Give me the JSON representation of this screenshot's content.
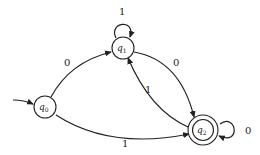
{
  "diagram": {
    "type": "finite-automaton",
    "states": [
      {
        "id": "q0",
        "name": "q",
        "sub": "0",
        "start": true,
        "accept": false
      },
      {
        "id": "q1",
        "name": "q",
        "sub": "1",
        "start": false,
        "accept": false
      },
      {
        "id": "q2",
        "name": "q",
        "sub": "2",
        "start": false,
        "accept": true
      }
    ],
    "transitions": [
      {
        "from": "q0",
        "to": "q1",
        "label": "0"
      },
      {
        "from": "q0",
        "to": "q2",
        "label": "1"
      },
      {
        "from": "q1",
        "to": "q1",
        "label": "1"
      },
      {
        "from": "q1",
        "to": "q2",
        "label": "0"
      },
      {
        "from": "q2",
        "to": "q1",
        "label": "1"
      },
      {
        "from": "q2",
        "to": "q2",
        "label": "0"
      }
    ]
  },
  "labels": {
    "q0_q1": "0",
    "q0_q2": "1",
    "q1_loop": "1",
    "q1_q2": "0",
    "q2_q1": "1",
    "q2_loop": "0"
  }
}
